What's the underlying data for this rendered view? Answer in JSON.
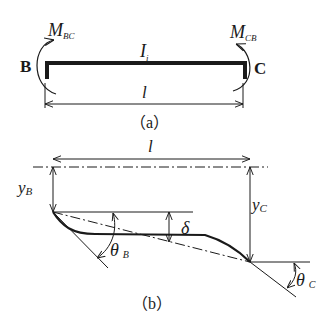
{
  "figure_a": {
    "caption": "（a）",
    "left_node": "B",
    "right_node": "C",
    "moment_left": {
      "symbol": "M",
      "subscript": "BC"
    },
    "moment_right": {
      "symbol": "M",
      "subscript": "CB"
    },
    "stiffness": {
      "symbol": "I",
      "subscript": "i"
    },
    "span_label": "l"
  },
  "figure_b": {
    "caption": "（b）",
    "span_label": "l",
    "y_left": {
      "symbol": "y",
      "subscript": "B"
    },
    "y_right": {
      "symbol": "y",
      "subscript": "C"
    },
    "delta": "δ",
    "theta_left": {
      "symbol": "θ",
      "subscript": "B"
    },
    "theta_right": {
      "symbol": "θ",
      "subscript": "C"
    }
  },
  "colors": {
    "ink": "#1a1a1a",
    "background": "#ffffff"
  }
}
